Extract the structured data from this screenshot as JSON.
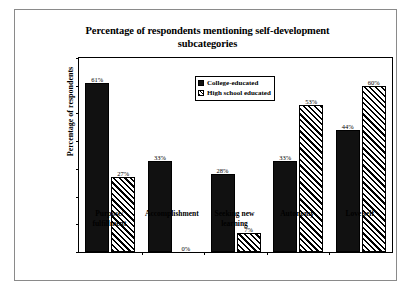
{
  "chart_data": {
    "type": "bar",
    "title": "Percentage of respondents mentioning self-development subcategories",
    "title_line1": "Percentage of respondents mentioning self-development",
    "title_line2": "subcategories",
    "xlabel": "",
    "ylabel": "Percentage of respondents",
    "ylim": [
      0,
      70
    ],
    "ytick_labels": [
      "0%",
      "10%",
      "20%",
      "30%",
      "40%",
      "50%",
      "60%",
      "70%"
    ],
    "ytick_values": [
      0,
      10,
      20,
      30,
      40,
      50,
      60,
      70
    ],
    "grid": false,
    "legend_position": "top-center",
    "categories": [
      "Purpose/ fulfillment",
      "Accomplishment",
      "Seeking new learning",
      "Autonomy",
      "Love self"
    ],
    "category_lines": [
      [
        "Purpose/",
        "fulfillment"
      ],
      [
        "Accomplishment"
      ],
      [
        "Seeking new",
        "learning"
      ],
      [
        "Autonomy"
      ],
      [
        "Love self"
      ]
    ],
    "series": [
      {
        "name": "College-educated",
        "fill": "solid",
        "color": "#111111",
        "values": [
          61,
          33,
          28,
          33,
          44
        ],
        "labels": [
          "61%",
          "33%",
          "28%",
          "33%",
          "44%"
        ]
      },
      {
        "name": "High school educated",
        "fill": "hatch",
        "color": "#000000",
        "values": [
          27,
          0,
          7,
          53,
          60
        ],
        "labels": [
          "27%",
          "0%",
          "7%",
          "53%",
          "60%"
        ]
      }
    ]
  },
  "legend": {
    "items": [
      {
        "label": "College-educated",
        "fill": "solid"
      },
      {
        "label": "High school educated",
        "fill": "hatch"
      }
    ]
  }
}
